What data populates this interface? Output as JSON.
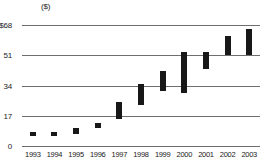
{
  "chart_data": {
    "type": "bar",
    "subtype": "high-low-range",
    "title": "",
    "subtitle": "",
    "unit_label": "($)",
    "xlabel": "",
    "ylabel": "",
    "ylim": [
      0,
      68
    ],
    "grid": true,
    "legend": false,
    "legend_position": "none",
    "y_ticks": [
      {
        "value": 68,
        "label": "$68"
      },
      {
        "value": 51,
        "label": "51"
      },
      {
        "value": 34,
        "label": "34"
      },
      {
        "value": 17,
        "label": "17"
      },
      {
        "value": 0,
        "label": "0"
      }
    ],
    "categories": [
      "1993",
      "1994",
      "1995",
      "1996",
      "1997",
      "1998",
      "1999",
      "2000",
      "2001",
      "2002",
      "2003"
    ],
    "series": [
      {
        "name": "Low",
        "values": [
          6,
          6,
          7,
          10,
          15,
          23,
          31,
          30,
          43,
          51,
          51
        ]
      },
      {
        "name": "High",
        "values": [
          8,
          8,
          10,
          13,
          25,
          35,
          42,
          53,
          53,
          62,
          66
        ]
      }
    ],
    "bars": [
      {
        "category": "1993",
        "low": 6,
        "high": 8
      },
      {
        "category": "1994",
        "low": 6,
        "high": 8
      },
      {
        "category": "1995",
        "low": 7,
        "high": 10
      },
      {
        "category": "1996",
        "low": 10,
        "high": 13
      },
      {
        "category": "1997",
        "low": 15,
        "high": 25
      },
      {
        "category": "1998",
        "low": 23,
        "high": 35
      },
      {
        "category": "1999",
        "low": 31,
        "high": 42
      },
      {
        "category": "2000",
        "low": 30,
        "high": 53
      },
      {
        "category": "2001",
        "low": 43,
        "high": 53
      },
      {
        "category": "2002",
        "low": 51,
        "high": 62
      },
      {
        "category": "2003",
        "low": 51,
        "high": 66
      }
    ],
    "colors": {
      "bar": "#181818",
      "gridline": "#6e6e6e",
      "text": "#1a1a1a",
      "background": "#ffffff"
    }
  }
}
